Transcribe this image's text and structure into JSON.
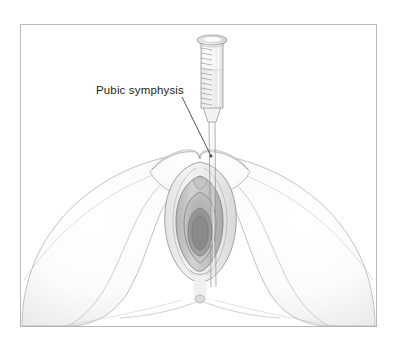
{
  "figure": {
    "domain_type": "medical-illustration",
    "title_visible": false,
    "background_color": "#ffffff",
    "frame": {
      "border_color": "#b9b9b9",
      "x": 20,
      "y": 24,
      "width": 357,
      "height": 303
    }
  },
  "annotations": [
    {
      "id": "pubic-symphysis",
      "text": "Pubic symphysis",
      "text_color": "#231f20",
      "font_size_px": 11.5,
      "x": 96,
      "y": 85,
      "leader_line": {
        "from_x": 182,
        "from_y": 97,
        "to_x": 211,
        "to_y": 156,
        "color": "#4a4a4a"
      }
    }
  ],
  "instrument": {
    "name": "syringe",
    "parts": [
      "plunger-flange",
      "barrel",
      "graduation-marks",
      "barrel-fluid",
      "luer-cone",
      "needle"
    ],
    "graduation_count": 12,
    "outline_color": "#9a9a9a",
    "fill_color": "#f4f4f4",
    "needle_tip_x": 213,
    "needle_tip_y": 285
  },
  "anatomy": {
    "view": "lithotomy-perineal",
    "structures": [
      "left-thigh",
      "right-thigh",
      "mons-pubis",
      "labia-majora",
      "labia-minora",
      "vaginal-introitus",
      "perineum",
      "anus"
    ],
    "line_color": "#8d8d8d",
    "shade_light": "#f3f3f3",
    "shade_mid": "#cfcfcf",
    "shade_dark": "#9e9e9e"
  },
  "palette": {
    "ink": "#231f20",
    "frame": "#b9b9b9",
    "outline": "#8d8d8d",
    "leader": "#4a4a4a",
    "paper": "#ffffff"
  }
}
